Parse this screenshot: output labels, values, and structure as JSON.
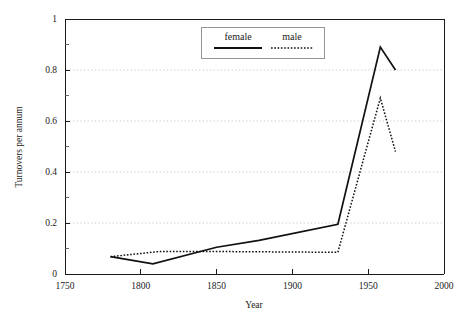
{
  "chart_data": {
    "type": "line",
    "title": "",
    "xlabel": "Year",
    "ylabel": "Turnovers per annum",
    "xlim": [
      1750,
      2000
    ],
    "ylim": [
      0,
      1
    ],
    "xticks": [
      1750,
      1800,
      1850,
      1900,
      1950,
      2000
    ],
    "xtick_labels": [
      "1750",
      "1800",
      "1850",
      "1900",
      "1950",
      "2000"
    ],
    "yticks": [
      0,
      0.2,
      0.4,
      0.6,
      0.8,
      1
    ],
    "ytick_labels": [
      "0",
      "0.2",
      "0.4",
      "0.6",
      "0.8",
      "1"
    ],
    "y_minor_ticks": [
      0.1,
      0.3,
      0.5,
      0.7,
      0.9
    ],
    "grid": "horizontal-dotted",
    "legend_position": "top-center",
    "series": [
      {
        "name": "female",
        "style": "solid",
        "color": "#111111",
        "x": [
          1780,
          1808,
          1850,
          1878,
          1930,
          1958,
          1968
        ],
        "values": [
          0.068,
          0.04,
          0.105,
          0.132,
          0.195,
          0.89,
          0.8
        ]
      },
      {
        "name": "male",
        "style": "dotted",
        "color": "#111111",
        "x": [
          1780,
          1812,
          1855,
          1930,
          1958,
          1968
        ],
        "values": [
          0.068,
          0.088,
          0.088,
          0.085,
          0.69,
          0.48
        ]
      }
    ]
  },
  "legend": {
    "entries": [
      {
        "label": "female"
      },
      {
        "label": "male"
      }
    ]
  },
  "axis_titles": {
    "x": "Year",
    "y": "Turnovers per annum"
  }
}
